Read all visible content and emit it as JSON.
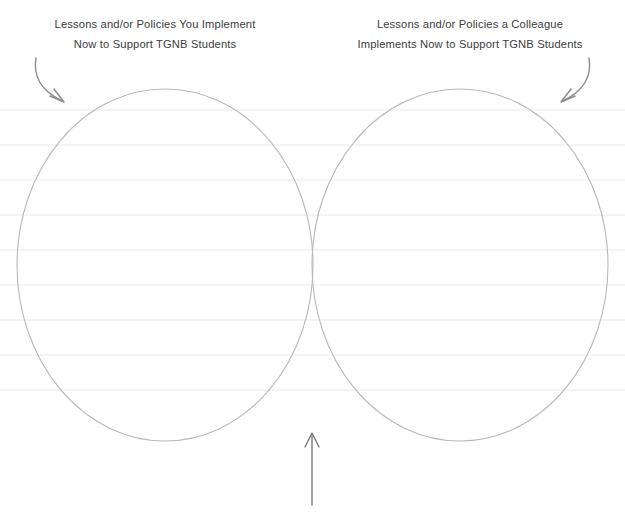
{
  "page": {
    "type": "venn-diagram-worksheet",
    "background_color": "#ffffff",
    "width": 625,
    "height": 519
  },
  "headings": {
    "left": {
      "line1": "Lessons and/or Policies You Implement",
      "line2": "Now to Support TGNB Students",
      "color": "#3c3c3c"
    },
    "right": {
      "line1": "Lessons and/or Policies a Colleague",
      "line2": "Implements Now to Support TGNB Students",
      "color": "#3c3c3c"
    }
  },
  "arrows": {
    "left": {
      "name": "curved-arrow-left",
      "color": "#8d8d8d",
      "direction": "down-right"
    },
    "right": {
      "name": "curved-arrow-right",
      "color": "#8d8d8d",
      "direction": "down-left"
    },
    "bottom": {
      "name": "straight-arrow-up",
      "color": "#6f6f79",
      "direction": "up",
      "label": ""
    }
  },
  "venn": {
    "stroke_color": "#b9b9b9",
    "fill": "none",
    "circles": [
      {
        "name": "left-circle",
        "cx": 165,
        "cy": 265,
        "rx": 148,
        "ry": 176
      },
      {
        "name": "right-circle",
        "cx": 460,
        "cy": 265,
        "rx": 148,
        "ry": 176
      }
    ]
  },
  "ruled_lines": {
    "color": "#f1f1f1",
    "spacing": 35,
    "start_y": 110,
    "count": 9,
    "x_start": 0,
    "x_end": 625
  }
}
